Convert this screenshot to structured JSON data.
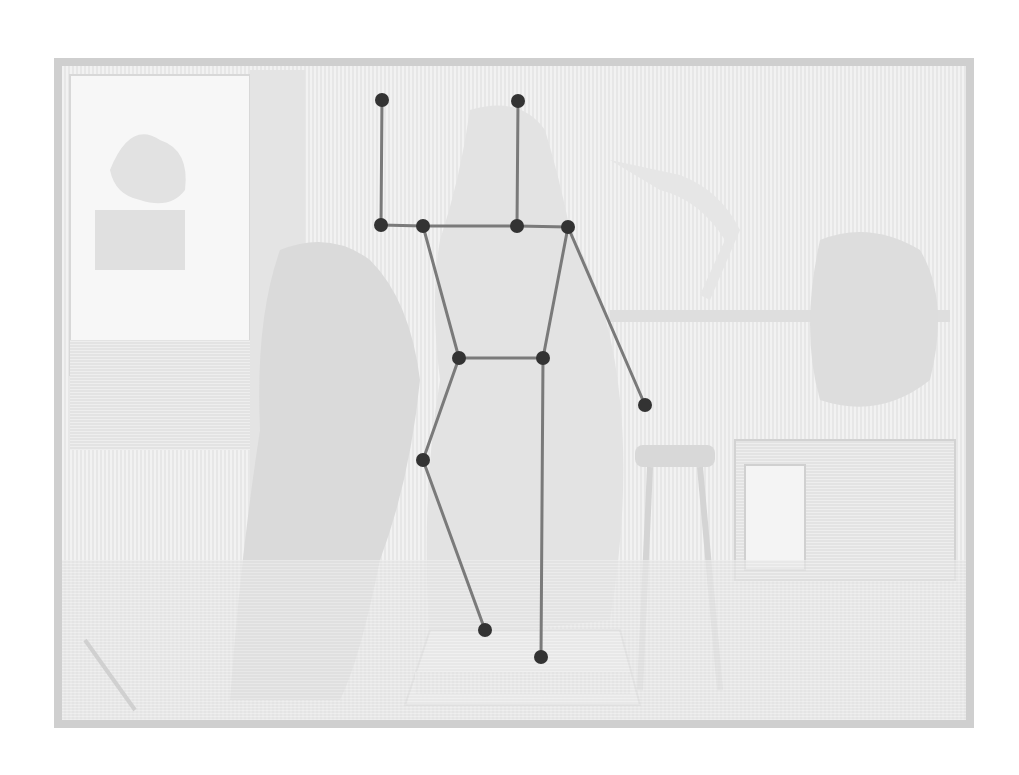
{
  "image": {
    "width": 1019,
    "height": 775,
    "description": "Faded woodcut engraving of a sculptor's studio with a draped statue, overlaid with a pose-estimation skeleton",
    "colors": {
      "background": "#ffffff",
      "engraving": "#d6d6d6",
      "engraving_dark": "#c4c4c4",
      "skeleton_line": "#7a7a7a",
      "keypoint": "#333333"
    },
    "frame": {
      "x": 58,
      "y": 62,
      "w": 912,
      "h": 662
    }
  },
  "skeleton": {
    "keypoints": [
      {
        "id": "left-hand-raised",
        "x": 382,
        "y": 100
      },
      {
        "id": "head-top",
        "x": 518,
        "y": 101
      },
      {
        "id": "left-shoulder-outer",
        "x": 381,
        "y": 225
      },
      {
        "id": "left-shoulder",
        "x": 423,
        "y": 226
      },
      {
        "id": "neck",
        "x": 517,
        "y": 226
      },
      {
        "id": "right-shoulder",
        "x": 568,
        "y": 227
      },
      {
        "id": "left-hip",
        "x": 459,
        "y": 358
      },
      {
        "id": "right-hip",
        "x": 543,
        "y": 358
      },
      {
        "id": "right-wrist",
        "x": 645,
        "y": 405
      },
      {
        "id": "left-knee",
        "x": 423,
        "y": 460
      },
      {
        "id": "left-ankle",
        "x": 485,
        "y": 630
      },
      {
        "id": "right-ankle",
        "x": 541,
        "y": 657
      }
    ],
    "edges": [
      [
        0,
        2
      ],
      [
        1,
        4
      ],
      [
        2,
        3
      ],
      [
        3,
        4
      ],
      [
        4,
        5
      ],
      [
        3,
        6
      ],
      [
        5,
        7
      ],
      [
        6,
        7
      ],
      [
        5,
        8
      ],
      [
        6,
        9
      ],
      [
        9,
        10
      ],
      [
        7,
        11
      ]
    ]
  }
}
